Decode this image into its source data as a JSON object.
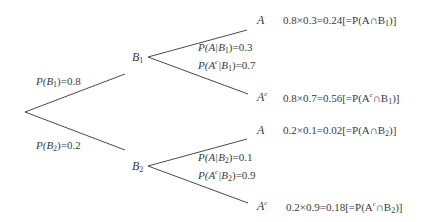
{
  "diagram": {
    "type": "probability-tree",
    "root": {
      "branches": [
        {
          "node": "B",
          "node_sub": "1",
          "edge_label": {
            "prefix": "P(B",
            "sub": "1",
            "suffix": ")=0.8"
          },
          "conditional_labels": [
            {
              "prefix": "P(A|B",
              "sub": "1",
              "suffix": ")=0.3"
            },
            {
              "a": "P(A",
              "sup": "c",
              "b": "|B",
              "sub": "1",
              "suffix": ")=0.7"
            }
          ],
          "leaves": [
            {
              "node": "A",
              "calc": "0.8×0.3=0.24[=P(A∩B",
              "calc_sub": "1",
              "calc_end": ")]"
            },
            {
              "node": "A",
              "node_sup": "c",
              "calc": "0.8×0.7=0.56[=P(A",
              "calc_sup": "c",
              "calc_mid": "∩B",
              "calc_sub": "1",
              "calc_end": ")]"
            }
          ]
        },
        {
          "node": "B",
          "node_sub": "2",
          "edge_label": {
            "prefix": "P(B",
            "sub": "2",
            "suffix": ")=0.2"
          },
          "conditional_labels": [
            {
              "prefix": "P(A|B",
              "sub": "2",
              "suffix": ")=0.1"
            },
            {
              "a": "P(A",
              "sup": "c",
              "b": "|B",
              "sub": "2",
              "suffix": ")=0.9"
            }
          ],
          "leaves": [
            {
              "node": "A",
              "calc": "0.2×0.1=0.02[=P(A∩B",
              "calc_sub": "2",
              "calc_end": ")]"
            },
            {
              "node": "A",
              "node_sup": "c",
              "calc": "0.2×0.9=0.18[=P(A",
              "calc_sup": "c",
              "calc_mid": "∩B",
              "calc_sub": "2",
              "calc_end": ")]"
            }
          ]
        }
      ]
    },
    "colors": {
      "line": "#4a4a4a",
      "text": "#3a3a3a",
      "background": "#ffffff"
    }
  }
}
